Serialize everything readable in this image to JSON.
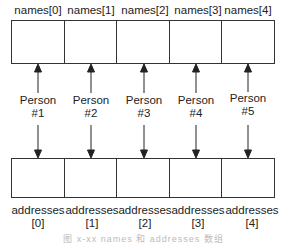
{
  "names": {
    "labels": [
      "names[0]",
      "names[1]",
      "names[2]",
      "names[3]",
      "names[4]"
    ]
  },
  "persons": [
    {
      "line1": "Person",
      "line2": "#1"
    },
    {
      "line1": "Person",
      "line2": "#2"
    },
    {
      "line1": "Person",
      "line2": "#3"
    },
    {
      "line1": "Person",
      "line2": "#4"
    },
    {
      "line1": "Person",
      "line2": "#5"
    }
  ],
  "addresses": [
    {
      "line1": "addresses",
      "line2": "[0]"
    },
    {
      "line1": "addresses",
      "line2": "[1]"
    },
    {
      "line1": "addresses",
      "line2": "[2]"
    },
    {
      "line1": "addresses",
      "line2": "[3]"
    },
    {
      "line1": "addresses",
      "line2": "[4]"
    }
  ],
  "caption": "图 x-xx names 和 addresses 数组",
  "colors": {
    "line": "#222222",
    "caption": "#bbbbbb"
  }
}
